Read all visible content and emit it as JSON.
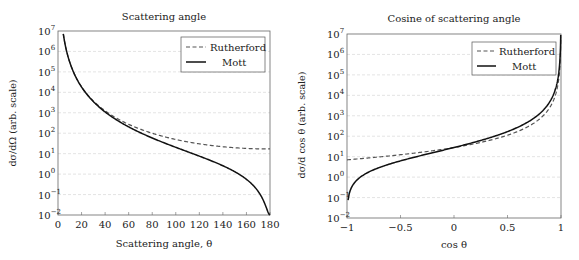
{
  "chart_data": [
    {
      "type": "line",
      "title": "Scattering angle",
      "xlabel": "Scattering angle, θ",
      "ylabel": "dσ/dΩ (arb. scale)",
      "xlim": [
        0,
        180
      ],
      "ylim": [
        0.01,
        10000000
      ],
      "yscale": "log",
      "x_ticks": [
        "0",
        "20",
        "40",
        "60",
        "80",
        "100",
        "120",
        "140",
        "160",
        "180"
      ],
      "y_ticks": [
        "10^-2",
        "10^-1",
        "10^0",
        "10^1",
        "10^2",
        "10^3",
        "10^4",
        "10^5",
        "10^6",
        "10^7"
      ],
      "grid": "horizontal dashed",
      "legend_position": "upper right",
      "series": [
        {
          "name": "Rutherford",
          "style": "dashed",
          "x": [
            5,
            10,
            20,
            40,
            60,
            80,
            100,
            120,
            140,
            160,
            180
          ],
          "values": [
            7000000,
            440000,
            28000,
            1900,
            430,
            160,
            80,
            45,
            29,
            21,
            17
          ]
        },
        {
          "name": "Mott",
          "style": "solid",
          "x": [
            5,
            10,
            20,
            40,
            60,
            80,
            100,
            120,
            140,
            160,
            178
          ],
          "values": [
            7000000,
            440000,
            27000,
            1700,
            320,
            94,
            33,
            11,
            3.4,
            0.6,
            0.01
          ]
        }
      ]
    },
    {
      "type": "line",
      "title": "Cosine of scattering angle",
      "xlabel": "cos θ",
      "ylabel": "dσ/d cos θ (arb. scale)",
      "xlim": [
        -1,
        1
      ],
      "ylim": [
        0.01,
        10000000
      ],
      "yscale": "log",
      "x_ticks": [
        "−1",
        "−0.5",
        "0",
        "0.5",
        "1"
      ],
      "y_ticks": [
        "10^-2",
        "10^-1",
        "10^0",
        "10^1",
        "10^2",
        "10^3",
        "10^4",
        "10^5",
        "10^6",
        "10^7"
      ],
      "grid": "horizontal dashed",
      "legend_position": "upper right",
      "series": [
        {
          "name": "Rutherford",
          "style": "dashed",
          "x": [
            -1,
            -0.5,
            0,
            0.5,
            0.8,
            0.95,
            0.99,
            0.999
          ],
          "values": [
            7,
            12,
            28,
            110,
            700,
            11000,
            280000,
            28000000
          ]
        },
        {
          "name": "Mott",
          "style": "solid",
          "x": [
            -0.99,
            -0.5,
            0,
            0.5,
            0.8,
            0.95,
            0.99,
            0.999
          ],
          "values": [
            0.07,
            3,
            14,
            83,
            630,
            10700,
            280000,
            28000000
          ]
        }
      ]
    }
  ],
  "legend": {
    "rutherford": "Rutherford",
    "mott": "Mott"
  },
  "left": {
    "title": "Scattering angle",
    "xlabel": "Scattering angle, θ",
    "ylabel_main": "dσ/dΩ",
    "ylabel_suffix": "(arb. scale)"
  },
  "right": {
    "title": "Cosine of scattering angle",
    "xlabel": "cos θ",
    "ylabel_main": "dσ/d cos θ",
    "ylabel_suffix": "(arb. scale)"
  },
  "left_xticks": [
    "0",
    "20",
    "40",
    "60",
    "80",
    "100",
    "120",
    "140",
    "160",
    "180"
  ],
  "right_xticks": [
    "−1",
    "−0.5",
    "0",
    "0.5",
    "1"
  ],
  "yticks": [
    "−2",
    "−1",
    "0",
    "1",
    "2",
    "3",
    "4",
    "5",
    "6",
    "7"
  ]
}
